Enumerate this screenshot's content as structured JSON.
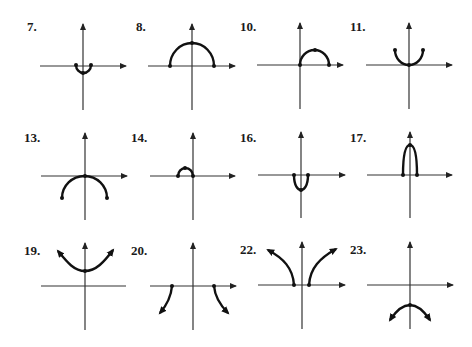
{
  "page": {
    "type": "exercise-answer-graphs",
    "background": "#ffffff",
    "ink": "#111111"
  },
  "graphs": [
    {
      "label": "7.",
      "shape": "small lower semicircle",
      "endpoints": "closed",
      "row": 1,
      "col": 1
    },
    {
      "label": "8.",
      "shape": "upper semicircle centered at origin",
      "endpoints": "closed",
      "row": 1,
      "col": 2
    },
    {
      "label": "10.",
      "shape": "upper semicircle right of y-axis",
      "endpoints": "closed",
      "row": 1,
      "col": 3
    },
    {
      "label": "11.",
      "shape": "lower semicircle above x-axis (U-shape)",
      "endpoints": "closed",
      "row": 1,
      "col": 4
    },
    {
      "label": "13.",
      "shape": "lower semicircle below x-axis touching origin",
      "endpoints": "closed",
      "row": 2,
      "col": 1
    },
    {
      "label": "14.",
      "shape": "small upper semicircle left of y-axis",
      "endpoints": "closed",
      "row": 2,
      "col": 2
    },
    {
      "label": "16.",
      "shape": "narrow U below x-axis",
      "endpoints": "closed",
      "row": 2,
      "col": 3
    },
    {
      "label": "17.",
      "shape": "tall narrow arch above x-axis",
      "endpoints": "closed",
      "row": 2,
      "col": 4
    },
    {
      "label": "19.",
      "shape": "upward parabola-like curve with vertex on y-axis",
      "endpoints": "arrows",
      "row": 3,
      "col": 1
    },
    {
      "label": "20.",
      "shape": "two branches descending from x-axis",
      "endpoints": "arrows",
      "row": 3,
      "col": 2
    },
    {
      "label": "22.",
      "shape": "two branches rising from x-axis",
      "endpoints": "arrows",
      "row": 3,
      "col": 3
    },
    {
      "label": "23.",
      "shape": "downward arch with vertex on negative y-axis",
      "endpoints": "arrows",
      "row": 3,
      "col": 4
    }
  ]
}
